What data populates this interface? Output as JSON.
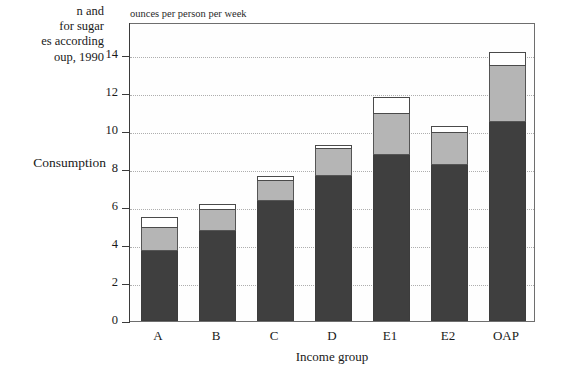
{
  "caption": {
    "lines": [
      "n and",
      " for sugar",
      "es according",
      "oup, 1990"
    ]
  },
  "series_label": "Consumption",
  "chart_data": {
    "type": "bar",
    "subtype": "stacked-bar",
    "title": "",
    "ylabel": "ounces per person per week",
    "xlabel": "Income group",
    "categories": [
      "A",
      "B",
      "C",
      "D",
      "E1",
      "E2",
      "OAP"
    ],
    "ylim": [
      0,
      14
    ],
    "yticks": [
      0,
      2,
      4,
      6,
      8,
      10,
      12,
      14
    ],
    "ytick_labels": [
      "0",
      "2",
      "4",
      "6",
      "8",
      "10",
      "12",
      "14"
    ],
    "grid": true,
    "grid_axis": "y",
    "legend": "none",
    "series": [
      {
        "name": "segment-1",
        "color": "#3f3f3f",
        "values": [
          3.7,
          4.75,
          6.3,
          7.65,
          8.75,
          8.2,
          10.5
        ]
      },
      {
        "name": "segment-2",
        "color": "#b5b5b5",
        "values": [
          1.2,
          1.1,
          1.05,
          1.4,
          2.15,
          1.7,
          2.9
        ]
      },
      {
        "name": "segment-3",
        "color": "#ffffff",
        "values": [
          0.5,
          0.25,
          0.25,
          0.15,
          0.85,
          0.3,
          0.7
        ]
      }
    ],
    "cumulative_tops": [
      {
        "category": "A",
        "segment_1_top": 3.7,
        "segment_2_top": 4.9,
        "total": 5.4
      },
      {
        "category": "B",
        "segment_1_top": 4.75,
        "segment_2_top": 5.85,
        "total": 6.1
      },
      {
        "category": "C",
        "segment_1_top": 6.3,
        "segment_2_top": 7.35,
        "total": 7.6
      },
      {
        "category": "D",
        "segment_1_top": 7.65,
        "segment_2_top": 9.05,
        "total": 9.2
      },
      {
        "category": "E1",
        "segment_1_top": 8.75,
        "segment_2_top": 10.9,
        "total": 11.75
      },
      {
        "category": "E2",
        "segment_1_top": 8.2,
        "segment_2_top": 9.9,
        "total": 10.2
      },
      {
        "category": "OAP",
        "segment_1_top": 10.5,
        "segment_2_top": 13.4,
        "total": 14.1
      }
    ]
  },
  "colors": {
    "segment_dark": "#3f3f3f",
    "segment_mid": "#b5b5b5",
    "segment_light": "#ffffff",
    "axis": "#3b3b3b",
    "grid": "#aeaeae",
    "frame": "#6e6e6e",
    "text": "#191919"
  }
}
